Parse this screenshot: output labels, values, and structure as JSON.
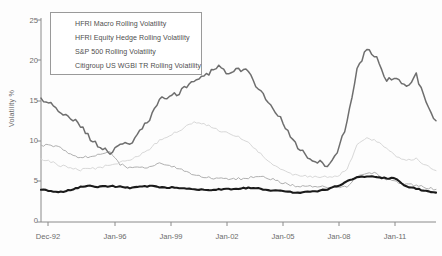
{
  "chart_data": {
    "type": "line",
    "title": "",
    "xlabel": "",
    "ylabel": "Volatility %",
    "ylim": [
      0,
      25
    ],
    "yticks": [
      0,
      5,
      10,
      15,
      20,
      25
    ],
    "xticks": [
      "Dec-92",
      "Jan-96",
      "Jan-99",
      "Jan-02",
      "Jan-05",
      "Jan-08",
      "Jan-11"
    ],
    "xlim": [
      "Dec-92",
      "Dec-12"
    ],
    "grid": false,
    "legend_position": "top-left",
    "colors": {
      "hfri_macro": "#b0b0b0",
      "hfri_equity_hedge": "#d8d8d8",
      "sp500": "#6e6e6e",
      "citigroup_wgbi": "#1a1a1a"
    },
    "x": [
      "1992-12",
      "1993-06",
      "1993-12",
      "1994-06",
      "1994-12",
      "1995-06",
      "1995-12",
      "1996-06",
      "1996-12",
      "1997-06",
      "1997-12",
      "1998-06",
      "1998-12",
      "1999-06",
      "1999-12",
      "2000-06",
      "2000-12",
      "2001-06",
      "2001-12",
      "2002-06",
      "2002-12",
      "2003-06",
      "2003-12",
      "2004-06",
      "2004-12",
      "2005-06",
      "2005-12",
      "2006-06",
      "2006-12",
      "2007-06",
      "2007-12",
      "2008-06",
      "2008-12",
      "2009-06",
      "2009-12",
      "2010-06",
      "2010-12",
      "2011-06",
      "2011-12",
      "2012-06",
      "2012-12"
    ],
    "series": [
      {
        "name": "HFRI Macro Rolling Volatility",
        "key": "hfri_macro",
        "values": [
          9.3,
          9.5,
          9.0,
          8.2,
          7.9,
          8.0,
          8.4,
          8.5,
          7.1,
          6.6,
          6.6,
          6.8,
          7.2,
          6.9,
          6.5,
          6.0,
          5.6,
          5.4,
          5.3,
          5.2,
          5.3,
          5.4,
          5.6,
          5.4,
          5.0,
          4.6,
          4.4,
          4.3,
          4.4,
          4.3,
          4.2,
          4.4,
          5.6,
          6.1,
          5.9,
          5.3,
          4.9,
          4.6,
          4.5,
          4.2,
          4.0
        ]
      },
      {
        "name": "HFRI Equity Hedge Rolling Volatility",
        "key": "hfri_equity_hedge",
        "values": [
          7.6,
          7.4,
          6.9,
          6.6,
          6.4,
          6.5,
          6.7,
          7.0,
          7.3,
          7.6,
          8.2,
          9.0,
          10.0,
          10.6,
          11.2,
          12.0,
          12.3,
          11.8,
          11.2,
          10.8,
          10.4,
          9.8,
          8.6,
          7.4,
          6.6,
          6.0,
          5.7,
          5.6,
          5.6,
          5.5,
          5.6,
          6.4,
          9.4,
          10.2,
          9.9,
          9.0,
          8.1,
          7.6,
          7.8,
          6.9,
          6.3
        ]
      },
      {
        "name": "S&P 500 Rolling Volatility",
        "key": "sp500",
        "values": [
          15.0,
          14.6,
          13.2,
          12.8,
          11.8,
          10.2,
          9.2,
          8.4,
          9.6,
          9.4,
          11.2,
          12.6,
          15.0,
          15.4,
          15.8,
          17.0,
          17.6,
          18.2,
          19.2,
          18.0,
          18.8,
          18.4,
          16.2,
          14.8,
          13.2,
          11.0,
          9.2,
          8.0,
          7.4,
          7.0,
          8.6,
          12.2,
          18.8,
          21.2,
          20.0,
          17.4,
          17.8,
          16.4,
          18.0,
          14.6,
          12.4
        ]
      },
      {
        "name": "Citigroup US WGBI TR Rolling Volatility",
        "key": "citigroup_wgbi",
        "values": [
          4.0,
          3.8,
          3.7,
          3.9,
          4.3,
          4.4,
          4.3,
          4.4,
          4.3,
          4.2,
          4.3,
          4.4,
          4.3,
          4.2,
          4.2,
          4.1,
          4.0,
          3.9,
          4.0,
          4.0,
          4.1,
          4.2,
          4.1,
          3.9,
          3.8,
          3.7,
          3.6,
          3.7,
          3.8,
          4.0,
          4.4,
          5.0,
          5.5,
          5.6,
          5.5,
          5.4,
          5.3,
          4.3,
          4.1,
          3.8,
          3.6
        ]
      }
    ]
  },
  "legend": {
    "items": [
      {
        "label": "HFRI Macro Rolling Volatility",
        "color": "#b0b0b0",
        "width": 1.1
      },
      {
        "label": "HFRI Equity Hedge Rolling Volatility",
        "color": "#dcdcdc",
        "width": 1.1
      },
      {
        "label": "S&P 500 Rolling Volatility",
        "color": "#6e6e6e",
        "width": 1.7
      },
      {
        "label": "Citigroup US WGBI TR Rolling Volatility",
        "color": "#1a1a1a",
        "width": 2.3
      }
    ]
  },
  "axes": {
    "y_title": "Volatility %",
    "y_ticks": [
      "25",
      "20",
      "15",
      "10",
      "5",
      "0"
    ],
    "x_ticks": [
      "Dec-92",
      "Jan-96",
      "Jan-99",
      "Jan-02",
      "Jan-05",
      "Jan-08",
      "Jan-11"
    ]
  }
}
